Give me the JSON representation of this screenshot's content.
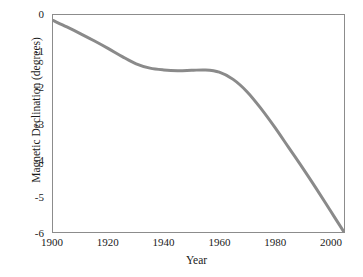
{
  "chart_data": {
    "type": "line",
    "title": "",
    "xlabel": "Year",
    "ylabel": "Magnetic Declination (degrees)",
    "xlim": [
      1900,
      2005
    ],
    "ylim": [
      -6,
      0
    ],
    "grid": false,
    "legend": null,
    "line_color": "#8a8a8a",
    "line_width": 3,
    "frame_color": "#8c8c8c",
    "xticks": [
      1900,
      1920,
      1940,
      1960,
      1980,
      2000
    ],
    "xtick_labels": [
      "1900",
      "1920",
      "1940",
      "1960",
      "1980",
      "2000"
    ],
    "yticks": [
      0,
      -1,
      -2,
      -3,
      -4,
      -5,
      -6
    ],
    "ytick_labels": [
      "0",
      "-1",
      "-2",
      "-3",
      "-4",
      "-5",
      "-6"
    ],
    "series": [
      {
        "name": "Magnetic Declination",
        "x": [
          1900,
          1905,
          1910,
          1915,
          1920,
          1925,
          1930,
          1935,
          1940,
          1945,
          1950,
          1955,
          1960,
          1965,
          1970,
          1975,
          1980,
          1985,
          1990,
          1995,
          2000,
          2005
        ],
        "y": [
          -0.15,
          -0.33,
          -0.52,
          -0.72,
          -0.93,
          -1.15,
          -1.35,
          -1.47,
          -1.52,
          -1.54,
          -1.53,
          -1.52,
          -1.58,
          -1.78,
          -2.12,
          -2.58,
          -3.1,
          -3.66,
          -4.22,
          -4.8,
          -5.4,
          -6.0
        ]
      }
    ]
  }
}
